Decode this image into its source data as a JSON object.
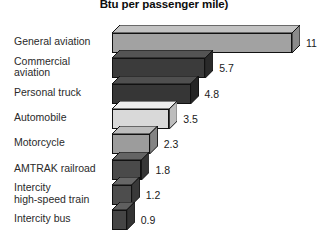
{
  "chart_data": {
    "type": "bar",
    "orientation": "horizontal",
    "style": "3d-isometric",
    "title": "Btu per passenger mile)",
    "xlabel": "",
    "ylabel": "",
    "grid": false,
    "legend": "none",
    "xlim": [
      0,
      11
    ],
    "categories": [
      "General aviation",
      "Commercial\naviation",
      "Personal truck",
      "Automobile",
      "Motorcycle",
      "AMTRAK railroad",
      "Intercity\nhigh-speed train",
      "Intercity bus"
    ],
    "values": [
      11,
      5.7,
      4.8,
      3.5,
      2.3,
      1.8,
      1.2,
      0.9
    ],
    "value_labels": [
      "11",
      "5.7",
      "4.8",
      "3.5",
      "2.3",
      "1.8",
      "1.2",
      "0.9"
    ],
    "bar_colors": [
      "#a2a2a2",
      "#3b3b3b",
      "#363636",
      "#d9d9d9",
      "#9c9c9c",
      "#4a4a4a",
      "#4d4d4d",
      "#454545"
    ],
    "bar_top_colors": [
      "#c2c2c2",
      "#545454",
      "#4f4f4f",
      "#efefef",
      "#bcbcbc",
      "#646464",
      "#676767",
      "#5f5f5f"
    ],
    "bar_side_colors": [
      "#8a8a8a",
      "#2a2a2a",
      "#262626",
      "#bdbdbd",
      "#848484",
      "#363636",
      "#393939",
      "#333333"
    ]
  },
  "colors": {
    "background": "#ffffff",
    "title_text": "#0d0d0d",
    "label_text": "#2a2a2a",
    "value_text": "#1a1a1a",
    "outline": "#111111"
  }
}
